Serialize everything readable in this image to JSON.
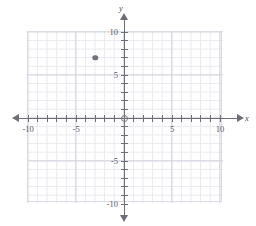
{
  "chart_data": {
    "type": "scatter",
    "title": "",
    "xlabel": "x",
    "ylabel": "y",
    "xlim": [
      -10,
      10
    ],
    "ylim": [
      -10,
      10
    ],
    "grid": true,
    "minor_grid_step": 1,
    "major_grid_step": 5,
    "legend": "none",
    "x_tick_labels": [
      "-10",
      "-5",
      "5",
      "10"
    ],
    "x_tick_values": [
      -10,
      -5,
      5,
      10
    ],
    "y_tick_labels": [
      "10",
      "5",
      "-5",
      "-10"
    ],
    "y_tick_values": [
      10,
      5,
      -5,
      -10
    ],
    "points": [
      {
        "label": "",
        "x": -3,
        "y": 7,
        "color": "#76707e"
      }
    ]
  },
  "axes": {
    "x_name": "x",
    "y_name": "y",
    "origin_label": "",
    "axis_color": "#6e6e78",
    "minor_grid_color": "#e9e9ef",
    "major_grid_color": "#d2d2dc"
  }
}
